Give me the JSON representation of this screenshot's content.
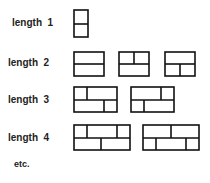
{
  "rows": [
    {
      "label": "length",
      "n": "1",
      "y": 23
    },
    {
      "label": "length",
      "n": "2",
      "y": 63
    },
    {
      "label": "length",
      "n": "3",
      "y": 100
    },
    {
      "label": "length",
      "n": "4",
      "y": 138
    }
  ],
  "footer": "etc."
}
